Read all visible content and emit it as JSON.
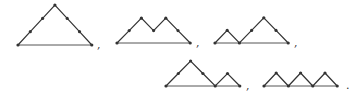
{
  "diagram": {
    "stroke_color": "#333333",
    "base_color": "#555555",
    "dot_color": "#333333",
    "paths": [
      {
        "id": "uuuddd",
        "steps": "UUUDDD",
        "origin": [
          18,
          45
        ],
        "dx": 12.3,
        "dy": 13.3,
        "show_all_dots": true,
        "separator": ",",
        "sep_pos": [
          97,
          39
        ]
      },
      {
        "id": "uududd",
        "steps": "UUDUDD",
        "origin": [
          117,
          43
        ],
        "dx": 12.2,
        "dy": 12.4,
        "show_all_dots": true,
        "separator": ",",
        "sep_pos": [
          196,
          37
        ]
      },
      {
        "id": "uduudd",
        "steps": "UDUUDD",
        "origin": [
          215,
          43
        ],
        "dx": 12.2,
        "dy": 12.6,
        "show_all_dots": true,
        "separator": ",",
        "sep_pos": [
          294,
          37
        ]
      },
      {
        "id": "uuddud",
        "steps": "UUDDUD",
        "origin": [
          166,
          86
        ],
        "dx": 12.3,
        "dy": 12.5,
        "show_all_dots": true,
        "separator": ",",
        "sep_pos": [
          246,
          80
        ]
      },
      {
        "id": "ududud",
        "steps": "UDUDUD",
        "origin": [
          264,
          86
        ],
        "dx": 12.2,
        "dy": 13.0,
        "show_all_dots": true,
        "separator": ".",
        "sep_pos": [
          346,
          80
        ]
      }
    ]
  }
}
